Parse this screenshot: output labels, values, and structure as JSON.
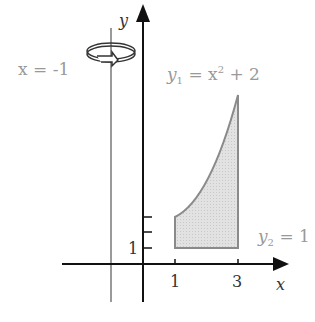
{
  "diagram": {
    "axis_labels": {
      "x": "x",
      "y": "y"
    },
    "rotation_axis_label": "x = -1",
    "curve_label": {
      "y": "y",
      "sub": "1",
      "eq": " = x",
      "sup": "2",
      "rest": " + 2"
    },
    "line_label": {
      "y": "y",
      "sub": "2",
      "eq": " = 1"
    },
    "x_ticks": [
      "1",
      "3"
    ],
    "y_ticks": [
      "1"
    ],
    "colors": {
      "axis": "#111111",
      "gray_line": "#9a9a9a",
      "region_fill": "#dcdcdc",
      "region_stroke": "#8a8a8a",
      "label_gray": "#999999"
    }
  }
}
